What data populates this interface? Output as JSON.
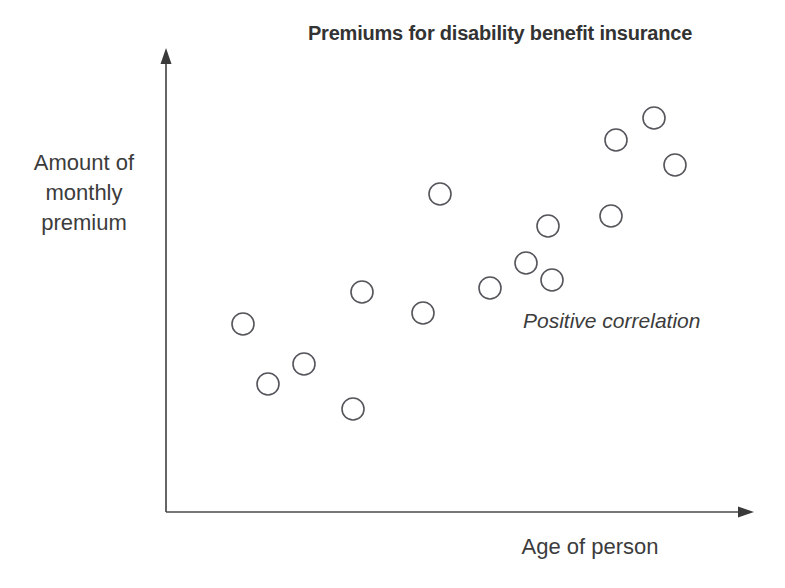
{
  "chart_data": {
    "type": "scatter",
    "title": "Premiums for disability benefit insurance",
    "xlabel": "Age of person",
    "ylabel": "Amount of monthly premium",
    "ylabel_lines": [
      "Amount of",
      "monthly",
      "premium"
    ],
    "annotation": "Positive correlation",
    "grid": false,
    "legend": false,
    "xlim": [
      0,
      100
    ],
    "ylim": [
      0,
      100
    ],
    "axis_ticks": [],
    "marker": {
      "shape": "circle",
      "fill": "none",
      "stroke": "#55555c",
      "radius_px": 11
    },
    "points_px": [
      {
        "x": 243,
        "y": 324
      },
      {
        "x": 268,
        "y": 384
      },
      {
        "x": 304,
        "y": 364
      },
      {
        "x": 353,
        "y": 409
      },
      {
        "x": 362,
        "y": 292
      },
      {
        "x": 423,
        "y": 313
      },
      {
        "x": 440,
        "y": 194
      },
      {
        "x": 490,
        "y": 288
      },
      {
        "x": 526,
        "y": 263
      },
      {
        "x": 548,
        "y": 226
      },
      {
        "x": 552,
        "y": 280
      },
      {
        "x": 611,
        "y": 216
      },
      {
        "x": 616,
        "y": 140
      },
      {
        "x": 654,
        "y": 118
      },
      {
        "x": 675,
        "y": 165
      }
    ],
    "x": [
      13.3,
      17.6,
      23.8,
      32.3,
      33.9,
      44.4,
      47.3,
      56.0,
      62.2,
      66.0,
      66.7,
      76.9,
      77.7,
      84.3,
      87.9
    ],
    "y": [
      41.4,
      28.2,
      32.5,
      22.6,
      48.4,
      43.8,
      70.1,
      49.2,
      54.7,
      62.8,
      50.9,
      64.9,
      81.6,
      86.4,
      76.1
    ],
    "n_points": 15,
    "correlation": "positive"
  },
  "axes": {
    "y_axis": {
      "x": 166,
      "y_top": 60,
      "y_bottom": 512
    },
    "x_axis": {
      "y": 512,
      "x_left": 166,
      "x_right": 742
    }
  }
}
